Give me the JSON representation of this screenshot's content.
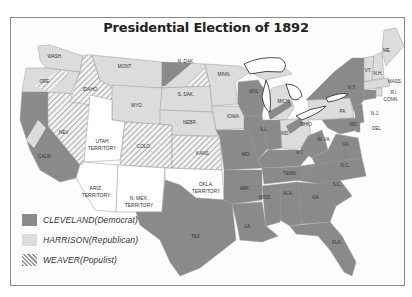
{
  "title": "Presidential Election of 1892",
  "colors": {
    "cleveland": "#8a8a8a",
    "harrison": "#dcdcdc",
    "weaver_stripe": "#9a9a9a",
    "territory": "#ffffff",
    "border": "#8a8a8a"
  },
  "legend": [
    {
      "name": "CLEVELAND",
      "party": "(Democrat)",
      "fill": "solid-dark"
    },
    {
      "name": "HARRISON",
      "party": "(Republican)",
      "fill": "solid-light"
    },
    {
      "name": "WEAVER",
      "party": "(Populist)",
      "fill": "hatched"
    }
  ],
  "state_labels": {
    "wash": "WASH.",
    "ore": "ORE.",
    "calif": "CALIF.",
    "nev": "NEV.",
    "idaho": "IDAHO",
    "mont": "MONT.",
    "wyo": "WYO.",
    "colo": "COLO.",
    "n_dak": "N. DAK.",
    "s_dak": "S. DAK.",
    "nebr": "NEBR.",
    "kans": "KANS.",
    "minn": "MINN.",
    "iowa": "IOWA",
    "mo": "MO.",
    "wis": "WIS.",
    "ill": "ILL.",
    "mich": "MICH.",
    "ind": "IND.",
    "ohio": "OHIO",
    "ky": "KY.",
    "tenn": "TENN.",
    "ark": "ARK.",
    "la": "LA.",
    "miss": "MISS.",
    "ala": "ALA.",
    "ga": "GA.",
    "fla": "FLA.",
    "sc": "S.C.",
    "nc": "N.C.",
    "va": "VA.",
    "wva": "W. VA.",
    "md": "MD.",
    "del": "DEL.",
    "nj": "N.J.",
    "pa": "PA.",
    "ny": "N.Y.",
    "vt": "VT.",
    "nh": "N.H.",
    "me": "ME.",
    "mass": "MASS.",
    "ri": "R.I.",
    "conn": "CONN.",
    "tex": "TEX."
  },
  "territory_labels": {
    "utah": [
      "UTAH",
      "TERRITORY"
    ],
    "ariz": [
      "ARIZ.",
      "TERRITORY"
    ],
    "nmex": [
      "N. MEX.",
      "TERRITORY"
    ],
    "okla": [
      "OKLA.",
      "TERRITORY"
    ]
  }
}
